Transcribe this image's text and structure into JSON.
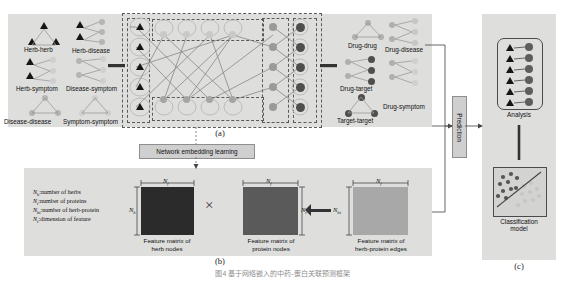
{
  "figure": {
    "bottom_caption": "图4 基于网络嵌入的中药-蛋白关联预测框架",
    "panel_letters": {
      "a": "(a)",
      "b": "(b)",
      "c": "(c)"
    }
  },
  "panel_a": {
    "left_network_labels": [
      "Herb-herb",
      "Herb-disease",
      "Herb-symptom",
      "Disease-symptom",
      "Disease-disease",
      "Symptom-symptom"
    ],
    "right_network_labels": [
      "Drug-drug",
      "Drug-disease",
      "Drug-target",
      "Drug-symptom",
      "Target-target"
    ]
  },
  "flow": {
    "network_embedding_learning": "Network embedding learning",
    "prediction": "Prediction"
  },
  "panel_b": {
    "legend": [
      {
        "symbol": "N",
        "sub": "h",
        "text": ":number of herbs"
      },
      {
        "symbol": "N",
        "sub": "t",
        "text": ":number of proteins"
      },
      {
        "symbol": "N",
        "sub": "ht",
        "text": ":number of herb-protein"
      },
      {
        "symbol": "N",
        "sub": "f",
        "text": ":dimension of feature"
      }
    ],
    "matrices": [
      {
        "caption_line1": "Feature matrix of",
        "caption_line2": "herb nodes",
        "dim_top": "N",
        "dim_top_sub": "f",
        "dim_side": "N",
        "dim_side_sub": "h",
        "color": "#2b2b2b"
      },
      {
        "caption_line1": "Feature matrix of",
        "caption_line2": "protein nodes",
        "dim_top": "N",
        "dim_top_sub": "f",
        "dim_side": "N",
        "dim_side_sub": "t",
        "color": "#5a5a5a"
      },
      {
        "caption_line1": "Feature matrix of",
        "caption_line2": "herb-protein edges",
        "dim_top": "N",
        "dim_top_sub": "f",
        "dim_side": "N",
        "dim_side_sub": "ht",
        "color": "#a8a8a8"
      }
    ],
    "operator_multiply": "×"
  },
  "panel_c": {
    "analysis_label": "Analysis",
    "classification_label_line1": "Classification",
    "classification_label_line2": "model"
  },
  "colors": {
    "panel_bg": "#dededd",
    "node_herb": "#161616",
    "node_light": "#c9c9c9",
    "node_mid": "#9a9a9a",
    "node_dark": "#4e4e4e",
    "edge": "#8a8a8a"
  }
}
